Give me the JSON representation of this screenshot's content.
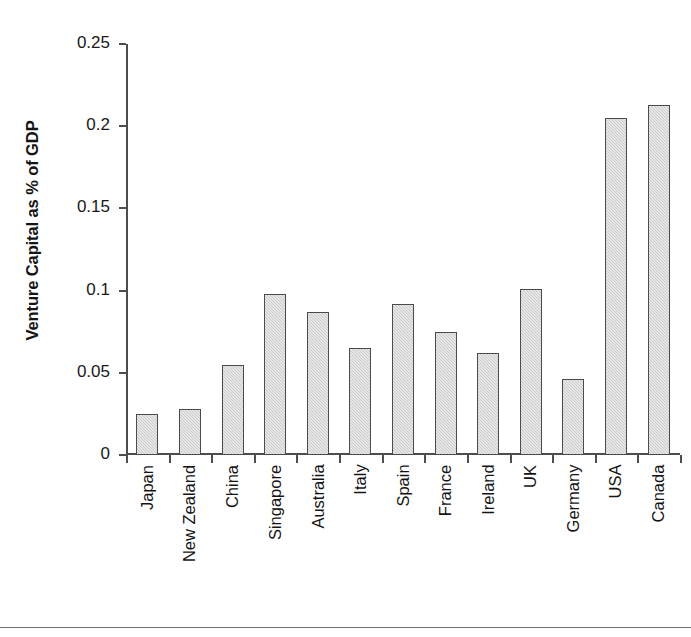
{
  "chart_data": {
    "type": "bar",
    "title": "",
    "xlabel": "",
    "ylabel": "Venture Capital as % of GDP",
    "ylim": [
      0,
      0.25
    ],
    "yticks": [
      "0",
      "0.05",
      "0.1",
      "0.15",
      "0.2",
      "0.25"
    ],
    "ytick_values": [
      0,
      0.05,
      0.1,
      0.15,
      0.2,
      0.25
    ],
    "grid": false,
    "legend": null,
    "bar_color": "#c9c9c9",
    "bar_edge_color": "#4a4a4a",
    "axis_color": "#4d4d4d",
    "categories": [
      "Japan",
      "New Zealand",
      "China",
      "Singapore",
      "Australia",
      "Italy",
      "Spain",
      "France",
      "Ireland",
      "UK",
      "Germany",
      "USA",
      "Canada"
    ],
    "values": [
      0.025,
      0.028,
      0.055,
      0.098,
      0.087,
      0.065,
      0.092,
      0.075,
      0.062,
      0.101,
      0.046,
      0.205,
      0.213
    ]
  },
  "axis": {
    "y_title": "Venture Capital as % of GDP"
  }
}
